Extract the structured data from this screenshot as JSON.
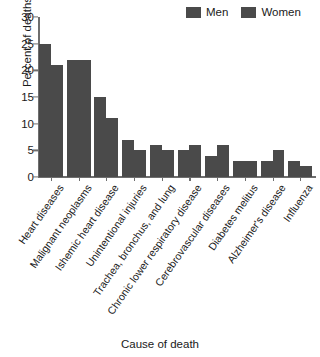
{
  "chart_data": {
    "type": "bar",
    "title": "",
    "xlabel": "Cause of death",
    "ylabel": "Percent of deaths",
    "ylim": [
      0,
      30
    ],
    "yticks": [
      0,
      5,
      10,
      15,
      20,
      25,
      30
    ],
    "grid": false,
    "legend_position": "top-right",
    "categories": [
      "Heart diseases",
      "Malignant neoplasms",
      "Ishemic heart disease",
      "Unintentional injuries",
      "Trachea, bronchus, and lung",
      "Chronic lower respiratory disease",
      "Cerebrovascular diseases",
      "Diabetes melitus",
      "Alzheimer's disease",
      "Influenza"
    ],
    "series": [
      {
        "name": "Men",
        "color": "#4a4a4a",
        "values": [
          25,
          22,
          15,
          7,
          6,
          5,
          4,
          3,
          3,
          3
        ]
      },
      {
        "name": "Women",
        "color": "#4a4a4a",
        "values": [
          21,
          22,
          11,
          5,
          5,
          6,
          6,
          3,
          5,
          2
        ]
      }
    ]
  },
  "legend": {
    "entries": [
      {
        "label": "Men"
      },
      {
        "label": "Women"
      }
    ]
  },
  "colors": {
    "bar": "#4a4a4a",
    "axis": "#6e6e6e",
    "text": "#1a1a1a",
    "background": "#ffffff"
  }
}
